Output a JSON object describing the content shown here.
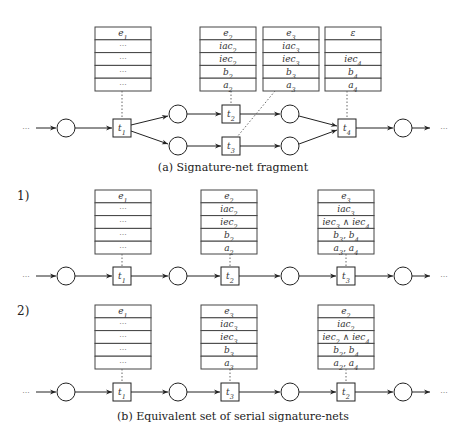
{
  "figure": {
    "part_a": {
      "caption": "(a) Signature-net fragment",
      "tables": [
        {
          "transition": "t1",
          "rows": [
            "e1",
            "…",
            "…",
            "…",
            "…"
          ]
        },
        {
          "transition": "t2",
          "rows": [
            "e2",
            "iac2",
            "iec2",
            "b2",
            "a2"
          ]
        },
        {
          "transition": "t3",
          "rows": [
            "e3",
            "iac3",
            "iec3",
            "b3",
            "a3"
          ]
        },
        {
          "transition": "t4",
          "rows": [
            "ε",
            "",
            "iec4",
            "b4",
            "a4"
          ]
        }
      ],
      "transitions": [
        "t1",
        "t2",
        "t3",
        "t4"
      ],
      "leading_ellipsis": "···",
      "trailing_ellipsis": "···"
    },
    "part_b": {
      "caption": "(b) Equivalent set of serial signature-nets",
      "nets": [
        {
          "label": "1)",
          "tables": [
            {
              "transition": "t1",
              "rows": [
                "e1",
                "…",
                "…",
                "…",
                "…"
              ]
            },
            {
              "transition": "t2",
              "rows": [
                "e2",
                "iac2",
                "iec2",
                "b2",
                "a2"
              ]
            },
            {
              "transition": "t3",
              "rows": [
                "e3",
                "iac3",
                "iec3 ∧ iec4",
                "b3, b4",
                "a3, a4"
              ]
            }
          ],
          "transitions": [
            "t1",
            "t2",
            "t3"
          ]
        },
        {
          "label": "2)",
          "tables": [
            {
              "transition": "t1",
              "rows": [
                "e1",
                "…",
                "…",
                "…",
                "…"
              ]
            },
            {
              "transition": "t3",
              "rows": [
                "e3",
                "iac3",
                "iec3",
                "b3",
                "a3"
              ]
            },
            {
              "transition": "t2",
              "rows": [
                "e2",
                "iac2",
                "iec2 ∧ iec4",
                "b2, b4",
                "a2, a4"
              ]
            }
          ],
          "transitions": [
            "t1",
            "t3",
            "t2"
          ]
        }
      ],
      "leading_ellipsis": "···",
      "trailing_ellipsis": "···"
    }
  }
}
